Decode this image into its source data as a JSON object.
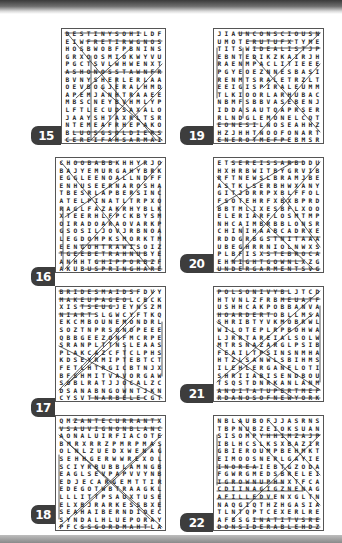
{
  "page": {
    "theme_colors": {
      "badge_bg": "#3d3d3d",
      "badge_text": "#ffffff",
      "grid_border": "#555555",
      "letters": "#222222"
    }
  },
  "puzzles": [
    {
      "number": "15",
      "rows": [
        "DESTINYSOHILDF",
        "EIWFRETIRWGNOS",
        "HOSBWOBFPBNINS",
        "GRXOOSMIOKWYVU",
        "PGCTSVLWHWENXT",
        "ASHONOSSTAWNFR",
        "BVNYSHERLERLAA",
        "OEVBOGJERALHMD",
        "APEMJANHTRAAEE",
        "MBSCNEYBVHMLYP",
        "LFTLECUDSAXALO",
        "JAAYSHTAXRLTSR",
        "NTEMEAFRHEPAKO",
        "BLUOSGSOLDIERS",
        "CEREIFAHSARMAI"
      ]
    },
    {
      "number": "16",
      "rows": [
        "CHOOBABBKHHYRJO",
        "BAJYEMURGAHYBRK",
        "EGGLEENOALLNDFF",
        "ENHUSEERNAROSHA",
        "TBESRLAPBERSINC",
        "ATELPINATLTRPXO",
        "RAGLFAZAKRHYBLK",
        "XTEERHLFPCKBYSM",
        "OIRADOARAOVARKP",
        "GSOSILJOVJRBNOA",
        "LEGDOMPKSMORKTM",
        "EENGOHTRAWISOIZ",
        "TGEEBETRAHNUBYE",
        "ANHHTGHIPPORBZF",
        "AKUBUSPRINGHARE"
      ]
    },
    {
      "number": "17",
      "rows": [
        "BRIDESMAIDSFDVY",
        "MAKEUPAGEOLCBCK",
        "XISTSEUGJEYNSZM",
        "NIARTSLGWCYFTKQ",
        "EKCMBOUNEMONDRLG",
        "SOZTNPRSONOPEEE",
        "QBBGEEZONFMCRPE",
        "SRANPLTTNSLEAAS",
        "PLAKCAZCFTCLPHS",
        "KDSEYRMIPTEBTCT",
        "FETLHTRGICBTNJX",
        "BFSHMITVAVORGAW",
        "SOBLRATJJOCALZC",
        "DSANABNGOWNTJKN",
        "CYSVTNARBELECGT"
      ]
    },
    {
      "number": "18",
      "rows": [
        "QMZANTECURRANTX",
        "VSAUVIGNONBLANC",
        "AONALUIRFIACOTE",
        "BMRXRRZPMRPMAS",
        "OLNLZUEDXWENAG",
        "SEHHGERWWREXOL",
        "SCIYRBUBBLAMNGB",
        "EAGLSEVPAPVVYNB",
        "EDJECARGEMTTIR",
        "EDEGOTWBTRAAGKL",
        "LLLITTPSAUXTUSE",
        "ELXBJRARKESSBXEB",
        "SEAHAIBERNDIOEC",
        "SYNDALHLUEPORAY",
        "PFCSSGORDMAHTLAW"
      ]
    },
    {
      "number": "19",
      "rows": [
        "JIAUNCONSCIOUSN",
        "UMOTERUTUFXTYME",
        "TITSWIDEALISTJP",
        "EBNTEDIKZKAIRJH",
        "RAENMPACLITIEEE",
        "PGYEOEZNNESBASI",
        "RENMTSRALETRZLT",
        "EEIGISPIRALEUMM",
        "TLKIOORLARHUBAC",
        "NBMFSBBVASEBENJ",
        "IDDASAUTQAPRSER",
        "RLNDGLEMONELCQT",
        "EONESILNOSEAHHZ",
        "HZJHHTNOOFONART",
        "ENEROTMEFPEBMSR"
      ]
    },
    {
      "number": "20",
      "rows": [
        "ETSEREISSARBDDU",
        "HXHRBWITBYGRVIB",
        "RFTNEWSLBRAMJBE",
        "ASTKLSERBHWXANY",
        "GITJDRRPXBLFFOL",
        "FSOTEHRFXBXBPRD",
        "BBTMLIXESBFLXOO",
        "ELERIARFLOSMTMP",
        "NHCAIMBRBBLONSR",
        "CHINIHAABCADRXE",
        "RDDGRBGSTNITAAA",
        "UBEGHRRNIOLNWXS",
        "PLBFISXSTEBROCA",
        "EHNIGHTGOWNLXZG",
        "UNDERGARMENTSVG"
      ]
    },
    {
      "number": "21",
      "rows": [
        "POLSONIVYBLJTCD",
        "HTVNLZFRBMEUATF",
        "USHHCAKPOBBANVA",
        "HOARDERTOBLLMSA",
        "SHRIBTYVKMOBRWL",
        "WILOTEPLRPBOHWA",
        "LJRRTAREIALSOLW",
        "MTRSNAZARGLPSIB",
        "FEAILTPSINSNMHA",
        "HTZLSANWLSBIHMS",
        "ILEHLERGANELOTI",
        "SHRIIABISENDBOU",
        "TSQSTDNRKANLANM",
        "ANOITATUPERTMEF",
        "RDANOSOFNEWYORK"
      ]
    },
    {
      "number": "22",
      "rows": [
        "NBLAUBOFJJASRNS",
        "TBPNUBZEIOKSUAN",
        "SISOMPYHHIMZAJP",
        "IBLHCSLKSXBAZIR",
        "GBIEROUMPBEHMKT",
        "EIMOOSNERLGAYIE",
        "INOREAIEBTGZODA",
        "FGWRGMEDSBRELEI",
        "IGROWNUPHNXTFCA",
        "CDIINAGIGZNENAG",
        "AFILLEDVENXGLTN",
        "NAQGIQTHZHGASIA",
        "TLNTQPTCEXERLRE",
        "AFBSGINATITVSRE",
        "DONSIDERABLEHDZ"
      ]
    }
  ]
}
